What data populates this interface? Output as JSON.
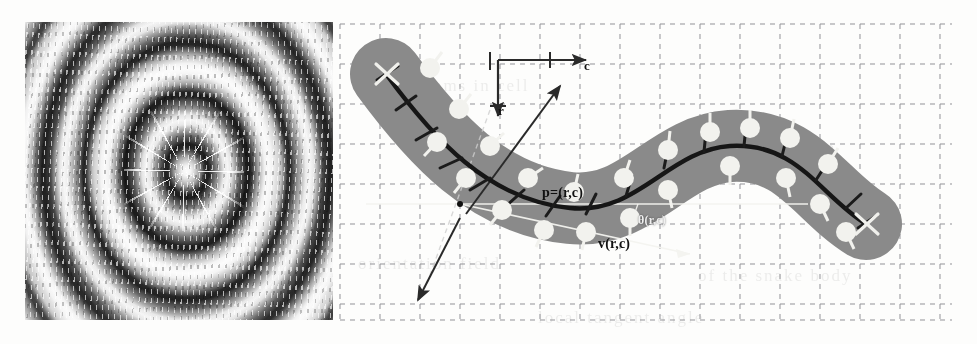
{
  "figure": {
    "caption": "",
    "panels": [
      {
        "id": "left",
        "kind": "interference-pattern-image",
        "description": "grayscale concentric elliptical moire interference pattern with central radial starburst"
      },
      {
        "id": "right",
        "kind": "snake-diagram",
        "description": "ribbon-shaped snake region over a dashed grid with sampled disc markers and tangent ticks"
      }
    ]
  },
  "axes": {
    "column_label": "c",
    "row_label": "r"
  },
  "annotations": {
    "point_label": "p=(r,c)",
    "vector_label": "v(r,c)",
    "angle_label": "θ(r,c)"
  },
  "colors": {
    "band_fill": "#8a8a8a",
    "grid_line": "#8d8d91",
    "centerline": "#161616",
    "disc_fill": "#f2f2ee",
    "page_bg": "#fdfdfc",
    "arrow": "#2a2a2a",
    "white_guide": "#f4f4f0"
  },
  "grid": {
    "cell_px": 40,
    "style": "dashed",
    "columns": 16,
    "rows": 8
  },
  "ghost_text": [
    "cilia rhythms in cell",
    "estimated sequence",
    "orientation field",
    "of the snake body",
    "local tangent angle"
  ]
}
